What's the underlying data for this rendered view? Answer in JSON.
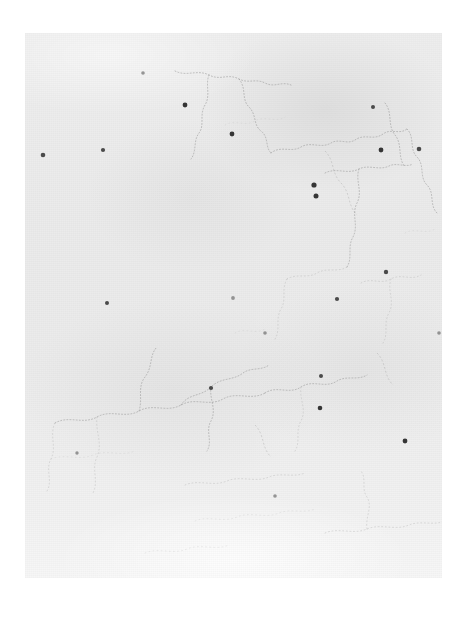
{
  "document": {
    "kind": "scanned-map-page",
    "title": "Faded scanned map sheet",
    "description": "A heavily faded, low-contrast scan of a printed map page showing stippled boundary contours and small dark settlement dots on light gray paper.",
    "visible_text": "",
    "legend_text": "",
    "page_number": ""
  },
  "canvas": {
    "width": 466,
    "height": 618,
    "background": "#ffffff"
  },
  "scan": {
    "left": 25,
    "top": 33,
    "width": 417,
    "height": 545,
    "paper_color": "#ececec",
    "paper_highlight": "#f7f7f7",
    "ink_color": "#8d8d8d",
    "marker_color": "#4a4a4a"
  },
  "map": {
    "contours": [
      {
        "id": "contour-north-arc",
        "class": "contour-line",
        "d": "M150 38 C162 44 172 36 184 42 C196 48 202 40 214 46 C224 51 230 45 240 50 C250 55 256 48 266 52"
      },
      {
        "id": "contour-north-branch",
        "class": "contour-line",
        "d": "M184 42 C180 52 186 62 180 72 C174 82 180 92 174 100 C168 108 172 118 166 126"
      },
      {
        "id": "contour-north-east-hook",
        "class": "contour-line",
        "d": "M214 46 C222 56 216 66 224 74 C232 82 228 92 236 98 C244 104 240 114 246 120"
      },
      {
        "id": "contour-upper-lobe",
        "class": "contour-line",
        "d": "M246 120 C256 112 266 120 276 114 C286 108 296 116 306 110 C314 105 322 112 330 107"
      },
      {
        "id": "contour-upper-right-a",
        "class": "contour-line",
        "d": "M330 107 C340 100 348 108 358 101 C366 95 374 102 382 96"
      },
      {
        "id": "contour-upper-right-b",
        "class": "contour-line",
        "d": "M360 70 C368 80 362 92 370 102 C378 112 372 124 380 134"
      },
      {
        "id": "contour-east-edge",
        "class": "contour-line",
        "d": "M382 96 C390 104 384 116 392 124 C400 132 394 144 402 152 C410 160 404 172 412 180"
      },
      {
        "id": "contour-mid-right-loop",
        "class": "contour-line",
        "d": "M300 140 C312 134 322 142 334 136 C344 131 354 138 364 133 C372 129 380 135 388 131"
      },
      {
        "id": "contour-mid-right-down",
        "class": "contour-line",
        "d": "M334 136 C330 148 338 158 332 170 C326 182 334 192 328 204 C322 214 328 224 322 234"
      },
      {
        "id": "contour-center-spur",
        "class": "contour-line faint",
        "d": "M322 234 C312 240 302 234 292 240 C282 246 272 240 262 246"
      },
      {
        "id": "contour-center-bridge",
        "class": "contour-line faint",
        "d": "M262 246 C256 256 262 266 256 276 C250 286 256 296 250 306"
      },
      {
        "id": "contour-right-lower-a",
        "class": "contour-line faint",
        "d": "M336 250 C346 244 356 252 366 246 C376 240 386 248 396 242"
      },
      {
        "id": "contour-right-lower-b",
        "class": "contour-line faint",
        "d": "M366 246 C362 258 370 268 364 280 C358 290 364 300 358 310"
      },
      {
        "id": "contour-mid-band-main",
        "class": "contour-line",
        "d": "M30 390 C44 382 58 392 72 384 C86 376 100 386 114 378 C128 370 142 380 156 372 C170 364 184 374 198 366 C212 358 226 368 240 360"
      },
      {
        "id": "contour-mid-band-upper",
        "class": "contour-line",
        "d": "M114 378 C118 366 112 354 120 344 C128 334 124 322 132 314"
      },
      {
        "id": "contour-mid-band-lobe",
        "class": "contour-line",
        "d": "M156 372 C164 360 176 364 186 354 C196 344 208 348 218 340 C226 334 236 338 244 332"
      },
      {
        "id": "contour-mid-band-lobe2",
        "class": "contour-line",
        "d": "M186 354 C184 366 192 376 186 388 C180 398 188 408 182 418"
      },
      {
        "id": "contour-mid-band-right",
        "class": "contour-line",
        "d": "M240 360 C252 352 264 362 276 354 C288 346 300 356 312 348 C322 342 332 348 342 342"
      },
      {
        "id": "contour-mid-band-right2",
        "class": "contour-line faint",
        "d": "M276 354 C274 366 282 376 276 388 C270 398 276 408 270 418"
      },
      {
        "id": "contour-west-tail",
        "class": "contour-line faint",
        "d": "M30 390 C24 402 32 414 26 426 C20 436 28 448 22 458"
      },
      {
        "id": "contour-west-tail2",
        "class": "contour-line faint",
        "d": "M72 384 C70 398 78 410 72 424 C66 436 74 448 68 460"
      },
      {
        "id": "contour-low-center",
        "class": "contour-line faint",
        "d": "M160 452 C174 446 188 454 202 448 C216 442 230 450 244 444 C256 439 268 445 280 440"
      },
      {
        "id": "contour-low-center2",
        "class": "contour-line veryfaint",
        "d": "M170 488 C184 482 198 490 212 484 C226 478 240 486 254 480 C266 475 278 481 290 476"
      },
      {
        "id": "contour-low-right",
        "class": "contour-line faint",
        "d": "M300 500 C314 494 328 502 342 496 C356 490 370 498 384 492 C396 487 408 493 420 488"
      },
      {
        "id": "contour-low-right2",
        "class": "contour-line faint",
        "d": "M342 496 C340 484 348 474 342 464 C336 456 342 446 336 438"
      },
      {
        "id": "contour-lower-left-edge",
        "class": "contour-line veryfaint",
        "d": "M26 426 C40 420 54 428 68 422 C82 416 96 424 110 418"
      },
      {
        "id": "contour-upper-left-wisp",
        "class": "contour-line veryfaint",
        "d": "M200 92 C210 86 220 94 230 88 C240 82 250 90 260 84"
      },
      {
        "id": "contour-right-wisp",
        "class": "contour-line veryfaint",
        "d": "M380 200 C390 194 400 202 410 196"
      },
      {
        "id": "contour-center-wisp",
        "class": "contour-line veryfaint",
        "d": "M210 300 C220 294 230 302 240 296"
      },
      {
        "id": "contour-low-wisp",
        "class": "contour-line veryfaint",
        "d": "M120 520 C134 514 148 522 162 516 C176 510 190 518 204 512"
      }
    ],
    "rivers": [
      {
        "id": "river-northeast",
        "class": "river-line",
        "d": "M300 118 C310 128 306 140 316 150 C326 160 322 172 332 182"
      },
      {
        "id": "river-east",
        "class": "river-line",
        "d": "M352 320 C362 330 358 342 368 352"
      },
      {
        "id": "river-center",
        "class": "river-line",
        "d": "M230 392 C240 402 236 414 246 424"
      }
    ],
    "settlements": [
      {
        "id": "dot-west-upper",
        "cx": 18,
        "cy": 122,
        "r": 2.3,
        "class": "settlement-dot"
      },
      {
        "id": "dot-west-upper-2",
        "cx": 78,
        "cy": 117,
        "r": 2.1,
        "class": "settlement-dot"
      },
      {
        "id": "dot-north-center",
        "cx": 160,
        "cy": 72,
        "r": 2.4,
        "class": "settlement-dot strong"
      },
      {
        "id": "dot-north-center-2",
        "cx": 207,
        "cy": 101,
        "r": 2.4,
        "class": "settlement-dot strong"
      },
      {
        "id": "dot-north-east",
        "cx": 348,
        "cy": 74,
        "r": 2.0,
        "class": "settlement-dot"
      },
      {
        "id": "dot-north-east-2",
        "cx": 356,
        "cy": 117,
        "r": 2.4,
        "class": "settlement-dot strong"
      },
      {
        "id": "dot-east-edge",
        "cx": 394,
        "cy": 116,
        "r": 2.3,
        "class": "settlement-dot"
      },
      {
        "id": "dot-upper-right-a",
        "cx": 289,
        "cy": 152,
        "r": 2.6,
        "class": "settlement-dot strong"
      },
      {
        "id": "dot-upper-right-b",
        "cx": 291,
        "cy": 163,
        "r": 2.5,
        "class": "settlement-dot strong"
      },
      {
        "id": "dot-mid-right",
        "cx": 312,
        "cy": 266,
        "r": 2.1,
        "class": "settlement-dot"
      },
      {
        "id": "dot-right-far",
        "cx": 361,
        "cy": 239,
        "r": 2.2,
        "class": "settlement-dot"
      },
      {
        "id": "dot-center-left",
        "cx": 82,
        "cy": 270,
        "r": 2.0,
        "class": "settlement-dot"
      },
      {
        "id": "dot-center",
        "cx": 208,
        "cy": 265,
        "r": 1.9,
        "class": "settlement-dot weak"
      },
      {
        "id": "dot-center-band",
        "cx": 186,
        "cy": 355,
        "r": 2.1,
        "class": "settlement-dot"
      },
      {
        "id": "dot-center-band-2",
        "cx": 296,
        "cy": 343,
        "r": 2.0,
        "class": "settlement-dot"
      },
      {
        "id": "dot-mid-lower",
        "cx": 240,
        "cy": 300,
        "r": 1.8,
        "class": "settlement-dot weak"
      },
      {
        "id": "dot-right-lower",
        "cx": 295,
        "cy": 375,
        "r": 2.3,
        "class": "settlement-dot strong"
      },
      {
        "id": "dot-right-lower-2",
        "cx": 380,
        "cy": 408,
        "r": 2.4,
        "class": "settlement-dot strong"
      },
      {
        "id": "dot-bottom-center",
        "cx": 250,
        "cy": 463,
        "r": 1.8,
        "class": "settlement-dot weak"
      },
      {
        "id": "dot-left-lower",
        "cx": 52,
        "cy": 420,
        "r": 1.7,
        "class": "settlement-dot weak"
      },
      {
        "id": "dot-north-west-far",
        "cx": 118,
        "cy": 40,
        "r": 1.8,
        "class": "settlement-dot weak"
      },
      {
        "id": "dot-east-mid-far",
        "cx": 414,
        "cy": 300,
        "r": 1.8,
        "class": "settlement-dot weak"
      }
    ]
  }
}
